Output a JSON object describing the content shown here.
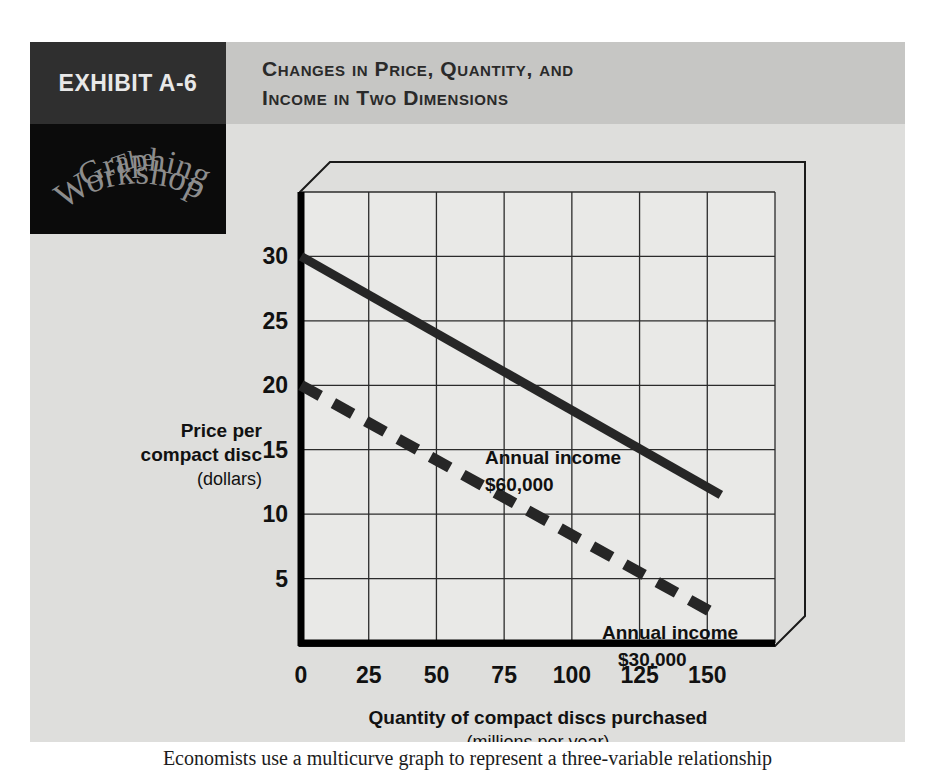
{
  "exhibit": {
    "tag": "EXHIBIT A-6",
    "title_line1": "Changes in Price, Quantity, and",
    "title_line2": "Income in Two Dimensions",
    "logo": {
      "line1": "The",
      "line2": "Graphing",
      "line3": "Workshop"
    },
    "caption": "Economists use a multicurve graph to represent a three-variable relationship"
  },
  "colors": {
    "panel_bg": "#dededc",
    "header_bg": "#c6c6c4",
    "tag_bg": "#2f2f2f",
    "logo_bg": "#0b0b0b",
    "axis": "#000000",
    "grid": "#2b2b2b",
    "series_solid": "#262626",
    "series_dashed": "#262626",
    "text": "#111111"
  },
  "chart_data": {
    "type": "line",
    "title": "Changes in Price, Quantity, and Income in Two Dimensions",
    "xlabel": "Quantity of compact discs purchased",
    "xlabel_sub": "(millions per year)",
    "ylabel_line1": "Price per",
    "ylabel_line2": "compact disc",
    "ylabel_sub": "(dollars)",
    "xticks": [
      0,
      25,
      50,
      75,
      100,
      125,
      150
    ],
    "xtick_labels": [
      "0",
      "25",
      "50",
      "75",
      "100",
      "125",
      "150"
    ],
    "yticks": [
      5,
      10,
      15,
      20,
      25,
      30
    ],
    "ytick_labels": [
      "5",
      "10",
      "15",
      "20",
      "25",
      "30"
    ],
    "xlim": [
      0,
      175
    ],
    "ylim": [
      0,
      35
    ],
    "grid": true,
    "grid_x": [
      0,
      25,
      50,
      75,
      100,
      125,
      150,
      175
    ],
    "grid_y": [
      0,
      5,
      10,
      15,
      20,
      25,
      30,
      35
    ],
    "legend": "annotations-inline",
    "series": [
      {
        "name": "Annual income $60,000",
        "style": "solid",
        "label_line1": "Annual income",
        "label_line2": "$60,000",
        "x": [
          0,
          155
        ],
        "y": [
          30,
          11.5
        ]
      },
      {
        "name": "Annual income $30,000",
        "style": "dashed",
        "label_line1": "Annual income",
        "label_line2": "$30,000",
        "x": [
          0,
          155
        ],
        "y": [
          20,
          2
        ]
      }
    ]
  }
}
